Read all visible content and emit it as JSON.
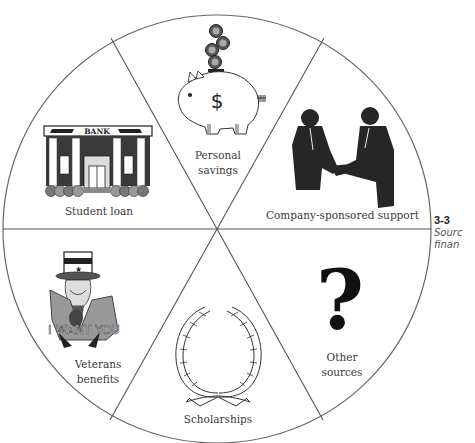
{
  "figure": {
    "number": "3-3",
    "caption_line1": "Sourc",
    "caption_line2": "finan"
  },
  "segments": [
    {
      "id": "personal-savings",
      "line1": "Personal",
      "line2": "savings",
      "icon": "piggy-bank-icon"
    },
    {
      "id": "company-sponsored-support",
      "label": "Company-sponsored support",
      "icon": "handshake-icon"
    },
    {
      "id": "other-sources",
      "line1": "Other",
      "line2": "sources",
      "icon": "question-mark-icon"
    },
    {
      "id": "scholarships",
      "label": "Scholarships",
      "icon": "laurel-wreath-icon"
    },
    {
      "id": "veterans-benefits",
      "line1": "Veterans",
      "line2": "benefits",
      "icon": "uncle-sam-icon"
    },
    {
      "id": "student-loan",
      "label": "Student loan",
      "icon": "bank-building-icon"
    }
  ],
  "icons": {
    "bank_sign": "BANK",
    "dollar_sign": "$",
    "coin_glyph": "¢",
    "uncle_sam_slogan": "I WANT YOU",
    "question_glyph": "?"
  },
  "colors": {
    "line": "#555555",
    "ink": "#1e1e1e",
    "label": "#3a3a3a"
  }
}
